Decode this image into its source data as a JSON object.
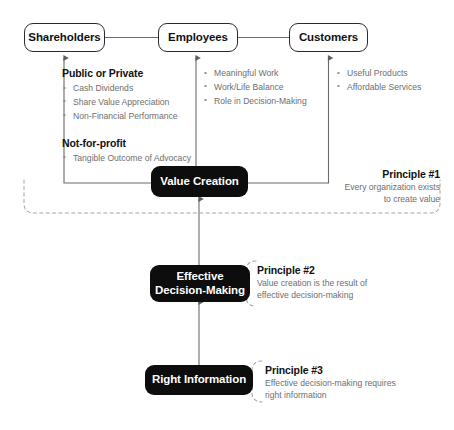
{
  "diagram": {
    "colors": {
      "solid_node_bg": "#0d0d0d",
      "solid_node_text": "#ffffff",
      "outline_node_border": "#2b2b2b",
      "outline_node_text": "#111111",
      "body_text": "#6e6e6e",
      "heading_text": "#111111",
      "connector": "#6b6b6b",
      "dashed_bracket": "#9a9a9a"
    }
  },
  "stakeholders": [
    {
      "label": "Shareholders",
      "name": "shareholders"
    },
    {
      "label": "Employees",
      "name": "employees"
    },
    {
      "label": "Customers",
      "name": "customers"
    }
  ],
  "details": {
    "shareholders": {
      "groups": [
        {
          "heading": "Public or Private",
          "items": [
            "Cash Dividends",
            "Share Value Appreciation",
            "Non-Financial Performance"
          ]
        },
        {
          "heading": "Not-for-profit",
          "items": [
            "Tangible Outcome of Advocacy"
          ]
        }
      ]
    },
    "employees": {
      "groups": [
        {
          "heading": "",
          "items": [
            "Meaningful Work",
            "Work/Life Balance",
            "Role in Decision-Making"
          ]
        }
      ]
    },
    "customers": {
      "groups": [
        {
          "heading": "",
          "items": [
            "Useful Products",
            "Affordable Services"
          ]
        }
      ]
    }
  },
  "layers": [
    {
      "label": "Value Creation",
      "name": "value-creation"
    },
    {
      "label": "Effective\nDecision-Making",
      "name": "effective-decision-making"
    },
    {
      "label": "Right Information",
      "name": "right-information"
    }
  ],
  "layer_labels": {
    "value_creation": "Value Creation",
    "effective_decision_making_line1": "Effective",
    "effective_decision_making_line2": "Decision-Making",
    "right_information": "Right Information"
  },
  "principles": [
    {
      "title": "Principle #1",
      "body": "Every organization exists\nto create value"
    },
    {
      "title": "Principle #2",
      "body": "Value creation is the result of\neffective decision-making"
    },
    {
      "title": "Principle #3",
      "body": "Effective decision-making requires\nright information"
    }
  ]
}
